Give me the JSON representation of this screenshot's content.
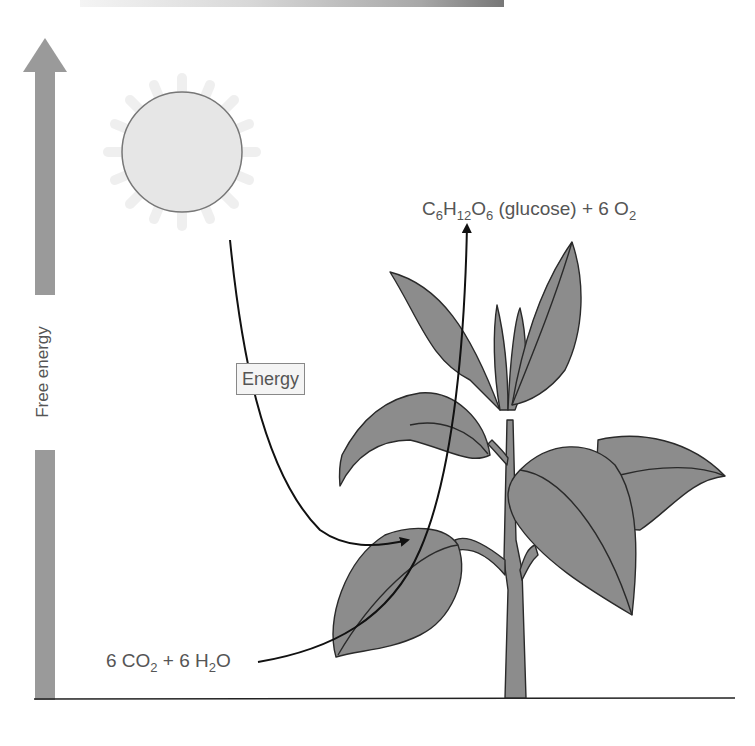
{
  "diagram": {
    "y_axis": {
      "label": "Free energy",
      "direction": "up"
    },
    "sun": {
      "name": "sun"
    },
    "energy_label": "Energy",
    "reactants": {
      "parts": [
        {
          "text": "6 CO",
          "sub": "2"
        },
        {
          "text": " + 6 H",
          "sub": "2"
        },
        {
          "text": "O",
          "sub": ""
        }
      ]
    },
    "products": {
      "parts": [
        {
          "text": "C",
          "sub": "6"
        },
        {
          "text": "H",
          "sub": "12"
        },
        {
          "text": "O",
          "sub": "6"
        },
        {
          "text": " (glucose) + 6 O",
          "sub": "2"
        }
      ]
    },
    "colors": {
      "axis": "#999999",
      "leaf_fill": "#8a8a8a",
      "outline": "#2a2a2a",
      "sun_fill": "#e6e6e6",
      "text": "#555555"
    }
  }
}
